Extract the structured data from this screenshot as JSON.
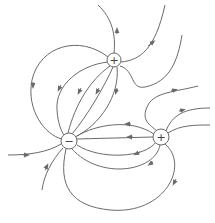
{
  "diagram": {
    "title": "",
    "charges": [
      {
        "id": "top-positive",
        "sign": "+",
        "x": 114,
        "y": 60,
        "r": 7
      },
      {
        "id": "left-negative",
        "sign": "−",
        "x": 69,
        "y": 141,
        "r": 8
      },
      {
        "id": "right-positive",
        "sign": "+",
        "x": 161,
        "y": 137,
        "r": 8
      }
    ],
    "colors": {
      "stroke": "#6a6a6a",
      "background": "#ffffff"
    }
  }
}
